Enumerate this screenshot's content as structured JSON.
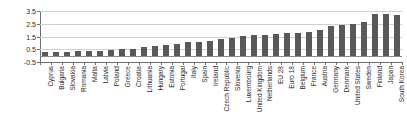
{
  "chart_data": {
    "type": "bar",
    "title": "",
    "subtitle": "",
    "xlabel": "",
    "ylabel": "",
    "ylim": [
      -0.5,
      3.5
    ],
    "ytick_labels": [
      "3.5",
      "2.5",
      "1.5",
      "0.5",
      "-0.5"
    ],
    "ytick_values": [
      3.5,
      2.5,
      1.5,
      0.5,
      -0.5
    ],
    "grid": true,
    "legend": "none",
    "bar_color": "#595959",
    "gridline_color": "#d0d0d0",
    "axis_color": "#6e6e6e",
    "categories": [
      "Cyprus",
      "Bulgaria",
      "Slovakia",
      "Romania",
      "Malta",
      "Latvia",
      "Poland",
      "Greece",
      "Croatia",
      "Lithuania",
      "Hungary",
      "Estonia",
      "Portugal",
      "Italy",
      "Spain",
      "Ireland",
      "Czech Republic",
      "Slovenia",
      "Luxembourg",
      "United Kingdom",
      "Netherlands",
      "EU 28",
      "Euro 18",
      "Belgium",
      "France",
      "Austria",
      "Germany",
      "Denmark",
      "United States",
      "Sweden",
      "Finland",
      "Japan",
      "South Korea"
    ],
    "values": [
      0.25,
      0.3,
      0.3,
      0.35,
      0.4,
      0.4,
      0.45,
      0.5,
      0.5,
      0.7,
      0.75,
      0.85,
      0.95,
      1.05,
      1.05,
      1.15,
      1.3,
      1.4,
      1.55,
      1.6,
      1.6,
      1.7,
      1.75,
      1.8,
      1.85,
      2.0,
      2.35,
      2.4,
      2.45,
      2.6,
      3.25,
      3.3,
      3.15
    ]
  }
}
